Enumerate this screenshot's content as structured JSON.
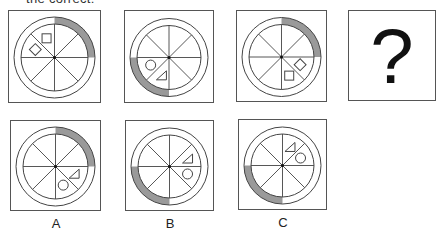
{
  "header": {
    "cut_text": "the correct:"
  },
  "colors": {
    "stroke": "#444444",
    "arc_fill": "#9a9a9a",
    "border": "#555555"
  },
  "question": {
    "panels": [
      {
        "id": "q1",
        "arc_quadrant": "top-right",
        "shapes": [
          {
            "type": "square",
            "sector": 6
          },
          {
            "type": "diamond",
            "sector": 5
          }
        ]
      },
      {
        "id": "q2",
        "arc_quadrant": "bottom-left",
        "shapes": [
          {
            "type": "circle",
            "sector": 4
          },
          {
            "type": "triangle",
            "sector": 3
          }
        ]
      },
      {
        "id": "q3",
        "arc_quadrant": "top-right",
        "shapes": [
          {
            "type": "diamond",
            "sector": 1
          },
          {
            "type": "square",
            "sector": 2
          }
        ]
      },
      {
        "id": "q4",
        "unknown": true,
        "symbol": "?"
      }
    ]
  },
  "options": [
    {
      "label": "A",
      "arc_quadrant": "top-right",
      "shapes": [
        {
          "type": "triangle",
          "sector": 1
        },
        {
          "type": "circle",
          "sector": 2
        }
      ]
    },
    {
      "label": "B",
      "arc_quadrant": "bottom-left",
      "shapes": [
        {
          "type": "triangle",
          "sector": 0
        },
        {
          "type": "circle",
          "sector": 1
        }
      ]
    },
    {
      "label": "C",
      "arc_quadrant": "bottom-left",
      "shapes": [
        {
          "type": "triangle",
          "sector": 7
        },
        {
          "type": "circle",
          "sector": 0
        }
      ]
    }
  ]
}
